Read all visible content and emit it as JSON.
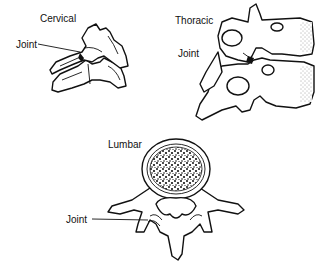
{
  "diagram": {
    "type": "anatomical-illustration",
    "panels": [
      {
        "id": "cervical",
        "title": "Cervical",
        "callout": "Joint"
      },
      {
        "id": "thoracic",
        "title": "Thoracic",
        "callout": "Joint"
      },
      {
        "id": "lumbar",
        "title": "Lumbar",
        "callout": "Joint"
      }
    ]
  }
}
